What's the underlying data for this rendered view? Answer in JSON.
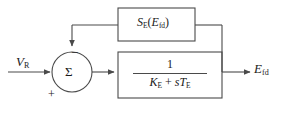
{
  "diagram": {
    "type": "control-system-block-diagram",
    "line_color": "#4a4a4a",
    "text_color": "#1a1a1a",
    "background": "#ffffff",
    "input": {
      "label_base": "V",
      "label_sub": "R",
      "full_label": "V_R"
    },
    "output": {
      "label_base": "E",
      "label_sub": "fd",
      "full_label": "E_fd"
    },
    "summing_junction": {
      "symbol": "Σ",
      "sign_input": "+",
      "sign_feedback": "−"
    },
    "forward_block": {
      "numerator": "1",
      "denominator_k": "K",
      "denominator_k_sub": "E",
      "denominator_op": "+",
      "denominator_s": "s",
      "denominator_t": "T",
      "denominator_t_sub": "E",
      "full_label": "1 / (K_E + sT_E)"
    },
    "feedback_block": {
      "fn_base": "S",
      "fn_sub": "E",
      "arg_open": "(",
      "arg_base": "E",
      "arg_sub": "fd",
      "arg_close": ")",
      "full_label": "S_E(E_fd)"
    }
  }
}
